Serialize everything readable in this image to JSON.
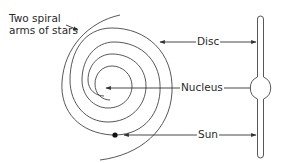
{
  "diagram": {
    "labels": {
      "arms_line1": "Two spiral",
      "arms_line2": "arms of stars",
      "disc": "Disc",
      "nucleus": "Nucleus",
      "sun": "Sun"
    },
    "views": [
      "spiral-top-view",
      "edge-on-side-view"
    ],
    "colors": {
      "line": "#333333",
      "text": "#2a2a2a",
      "background": "#ffffff"
    }
  }
}
